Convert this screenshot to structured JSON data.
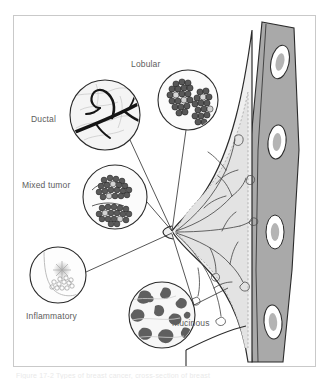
{
  "figure": {
    "caption": "Figure 17-2  Types of breast cancer, cross-section of breast",
    "frame_color": "#c9c9c9",
    "background": "#ffffff",
    "label_color": "#5d5d5d"
  },
  "labels": {
    "ductal": "Ductal",
    "lobular": "Lobular",
    "mixed_tumor": "Mixed tumor",
    "inflammatory": "Inflammatory",
    "mucinous": "Mucinous"
  },
  "callouts": [
    {
      "name": "ductal",
      "label": "Ductal",
      "cx": 105,
      "cy": 115,
      "r": 35
    },
    {
      "name": "lobular",
      "label": "Lobular",
      "cx": 188,
      "cy": 100,
      "r": 30
    },
    {
      "name": "mixed-tumor",
      "label": "Mixed tumor",
      "cx": 115,
      "cy": 197,
      "r": 32
    },
    {
      "name": "inflammatory",
      "label": "Inflammatory",
      "cx": 58,
      "cy": 275,
      "r": 28
    },
    {
      "name": "mucinous",
      "label": "Mucinous",
      "cx": 162,
      "cy": 315,
      "r": 33
    }
  ],
  "anatomy": {
    "nipple_point": {
      "x": 172,
      "y": 232
    },
    "rib_count": 4,
    "colors": {
      "skin_fill": "#efefef",
      "gland_fill": "#e3e3e3",
      "muscle_fill": "#a9a9a9",
      "rib_fill": "#ffffff",
      "rib_center": "#b4b4b4",
      "outline": "#2b2b2b",
      "duct_line": "#4a4a4a"
    }
  }
}
